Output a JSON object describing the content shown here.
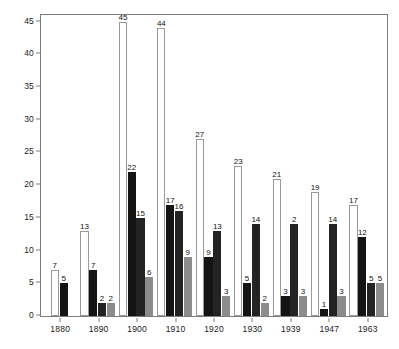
{
  "chart_data": {
    "type": "bar",
    "title": "",
    "subtitle": "",
    "xlabel": "",
    "ylabel": "",
    "categories": [
      "1880",
      "1890",
      "1900",
      "1910",
      "1920",
      "1930",
      "1939",
      "1947",
      "1963"
    ],
    "ylim": [
      0,
      46
    ],
    "yticks": [
      0,
      5,
      10,
      15,
      20,
      25,
      30,
      35,
      40,
      45
    ],
    "ytick_labels": [
      "0",
      "5",
      "10",
      "15",
      "20",
      "25",
      "30",
      "35",
      "40",
      "45"
    ],
    "grid": false,
    "legend": "none",
    "series": [
      {
        "name": "series-1",
        "fill": "#ffffff",
        "stroke": "#9a9a9a",
        "values": [
          7,
          13,
          45,
          44,
          27,
          23,
          21,
          19,
          17
        ]
      },
      {
        "name": "series-2",
        "fill": "#141414",
        "stroke": "#141414",
        "values": [
          5,
          7,
          22,
          17,
          9,
          5,
          3,
          1,
          12
        ]
      },
      {
        "name": "series-3",
        "fill": "#232323",
        "stroke": "#232323",
        "values": [
          null,
          2,
          15,
          16,
          13,
          14,
          14,
          14,
          5
        ]
      },
      {
        "name": "series-4",
        "fill": "#8c8c8c",
        "stroke": "#8c8c8c",
        "values": [
          null,
          2,
          6,
          9,
          3,
          2,
          3,
          3,
          5
        ]
      }
    ],
    "bar_labels": [
      [
        "7",
        "5",
        "",
        ""
      ],
      [
        "13",
        "7",
        "2",
        "2"
      ],
      [
        "45",
        "22",
        "15",
        "6"
      ],
      [
        "44",
        "17",
        "16",
        "9"
      ],
      [
        "27",
        "9",
        "13",
        "3"
      ],
      [
        "23",
        "5",
        "14",
        "2"
      ],
      [
        "21",
        "3",
        "2",
        "3"
      ],
      [
        "19",
        "1",
        "14",
        "3"
      ],
      [
        "17",
        "12",
        "5",
        "5"
      ]
    ],
    "colors": {
      "axis": "#7d7d7d",
      "text": "#1a1a1a",
      "background": "#ffffff",
      "series_1_fill": "#ffffff",
      "series_2_fill": "#141414",
      "series_3_fill": "#232323",
      "series_4_fill": "#8c8c8c"
    }
  }
}
